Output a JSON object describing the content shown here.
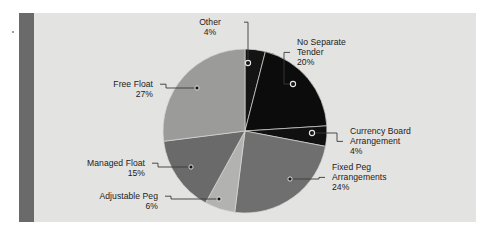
{
  "figure": {
    "panel_background": "#e3e3e1",
    "accent_bar_color": "#6a6a6a",
    "leader_line_color": "#3a3a3a"
  },
  "chart_data": {
    "type": "pie",
    "title": "",
    "subtitle": "",
    "xlabel": "",
    "ylabel": "",
    "legend_position": "callout-labels",
    "grid": false,
    "units": "percent",
    "total": 100,
    "start_angle_deg": 0,
    "direction": "clockwise",
    "categories": [
      "Other",
      "No Separate Tender",
      "Currency Board Arrangement",
      "Fixed Peg Arrangements",
      "Adjustable Peg",
      "Managed Float",
      "Free Float"
    ],
    "values": [
      4,
      20,
      4,
      24,
      6,
      15,
      27
    ],
    "slices": [
      {
        "name": "Other",
        "label_lines": [
          "Other"
        ],
        "value": 4,
        "value_text": "4%",
        "color": "#141414",
        "marker": "open",
        "marker_x": 248,
        "marker_y": 63,
        "label_x": 210,
        "label_y": 17,
        "label_align": "center"
      },
      {
        "name": "No Separate Tender",
        "label_lines": [
          "No Separate",
          "Tender"
        ],
        "value": 20,
        "value_text": "20%",
        "color": "#0c0c0c",
        "marker": "open",
        "marker_x": 293,
        "marker_y": 84,
        "label_x": 297,
        "label_y": 37,
        "label_align": "left"
      },
      {
        "name": "Currency Board Arrangement",
        "label_lines": [
          "Currency Board",
          "Arrangement"
        ],
        "value": 4,
        "value_text": "4%",
        "color": "#101010",
        "marker": "open",
        "marker_x": 312,
        "marker_y": 133,
        "label_x": 350,
        "label_y": 126,
        "label_align": "left"
      },
      {
        "name": "Fixed Peg Arrangements",
        "label_lines": [
          "Fixed Peg",
          "Arrangements"
        ],
        "value": 24,
        "value_text": "24%",
        "color": "#6f6f6f",
        "marker": "filled",
        "marker_x": 290,
        "marker_y": 179,
        "label_x": 332,
        "label_y": 162,
        "label_align": "left"
      },
      {
        "name": "Adjustable Peg",
        "label_lines": [
          "Adjustable Peg"
        ],
        "value": 6,
        "value_text": "6%",
        "color": "#b2b2b0",
        "marker": "filled",
        "marker_x": 219,
        "marker_y": 199,
        "label_x": 158,
        "label_y": 191,
        "label_align": "right"
      },
      {
        "name": "Managed Float",
        "label_lines": [
          "Managed Float"
        ],
        "value": 15,
        "value_text": "15%",
        "color": "#6a6a6a",
        "marker": "filled",
        "marker_x": 191,
        "marker_y": 167,
        "label_x": 145,
        "label_y": 158,
        "label_align": "right"
      },
      {
        "name": "Free Float",
        "label_lines": [
          "Free Float"
        ],
        "value": 27,
        "value_text": "27%",
        "color": "#9b9b99",
        "marker": "filled",
        "marker_x": 197,
        "marker_y": 88,
        "label_x": 153,
        "label_y": 79,
        "label_align": "right"
      }
    ]
  }
}
